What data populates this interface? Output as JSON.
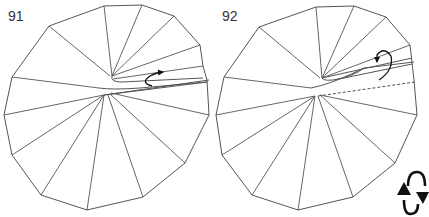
{
  "steps": [
    {
      "number": "91",
      "outline": [
        [
          104,
          6
        ],
        [
          142,
          5
        ],
        [
          174,
          16
        ],
        [
          200,
          45
        ],
        [
          203,
          66
        ],
        [
          207,
          80
        ],
        [
          209,
          115
        ],
        [
          185,
          163
        ],
        [
          143,
          197
        ],
        [
          87,
          210
        ],
        [
          41,
          195
        ],
        [
          12,
          155
        ],
        [
          4,
          115
        ],
        [
          12,
          77
        ],
        [
          49,
          26
        ]
      ],
      "creases": [
        [
          [
            104,
            6
          ],
          [
            112,
            76
          ]
        ],
        [
          [
            142,
            5
          ],
          [
            112,
            76
          ]
        ],
        [
          [
            174,
            16
          ],
          [
            112,
            76
          ]
        ],
        [
          [
            200,
            45
          ],
          [
            112,
            76
          ]
        ],
        [
          [
            203,
            66
          ],
          [
            113,
            79
          ]
        ],
        [
          [
            49,
            26
          ],
          [
            110,
            76
          ]
        ],
        [
          [
            12,
            77
          ],
          [
            99,
            88
          ]
        ],
        [
          [
            4,
            115
          ],
          [
            104,
            95
          ]
        ],
        [
          [
            12,
            155
          ],
          [
            104,
            95
          ]
        ],
        [
          [
            41,
            195
          ],
          [
            104,
            95
          ]
        ],
        [
          [
            87,
            210
          ],
          [
            104,
            95
          ]
        ],
        [
          [
            143,
            197
          ],
          [
            108,
            95
          ]
        ],
        [
          [
            185,
            163
          ],
          [
            110,
            94
          ]
        ],
        [
          [
            209,
            115
          ],
          [
            111,
            93
          ]
        ]
      ],
      "fold_paths": [
        "M112,76 Q110,82 122,82 L203,78",
        "M99,88 Q112,90 140,88 L207,82",
        "M104,95 L207,82",
        "M104,95 L209,80"
      ],
      "arrow_path": "M152,86 Q140,83 150,76 Q158,72 163,72"
    },
    {
      "number": "92",
      "outline": [
        [
          102,
          7
        ],
        [
          140,
          6
        ],
        [
          172,
          17
        ],
        [
          196,
          45
        ],
        [
          200,
          80
        ],
        [
          203,
          115
        ],
        [
          181,
          163
        ],
        [
          139,
          197
        ],
        [
          84,
          210
        ],
        [
          38,
          195
        ],
        [
          8,
          155
        ],
        [
          2,
          115
        ],
        [
          10,
          77
        ],
        [
          45,
          27
        ]
      ],
      "creases": [
        [
          [
            102,
            7
          ],
          [
            108,
            78
          ]
        ],
        [
          [
            140,
            6
          ],
          [
            108,
            78
          ]
        ],
        [
          [
            172,
            17
          ],
          [
            108,
            78
          ]
        ],
        [
          [
            196,
            45
          ],
          [
            108,
            78
          ]
        ],
        [
          [
            45,
            27
          ],
          [
            106,
            78
          ]
        ],
        [
          [
            10,
            77
          ],
          [
            97,
            88
          ]
        ],
        [
          [
            2,
            115
          ],
          [
            101,
            96
          ]
        ],
        [
          [
            8,
            155
          ],
          [
            101,
            96
          ]
        ],
        [
          [
            38,
            195
          ],
          [
            101,
            96
          ]
        ],
        [
          [
            84,
            210
          ],
          [
            101,
            96
          ]
        ],
        [
          [
            139,
            197
          ],
          [
            104,
            96
          ]
        ],
        [
          [
            181,
            163
          ],
          [
            106,
            95
          ]
        ],
        [
          [
            203,
            115
          ],
          [
            106,
            95
          ]
        ]
      ],
      "fold_paths": [
        "M108,78 Q110,82 125,79 L198,64",
        "M108,78 L198,58",
        "M97,88 Q118,84 150,68",
        "M150,68 L200,62",
        "M150,68 Q140,76 120,80"
      ],
      "dashed_path": "M104,96 L201,82",
      "arrow_path": "M165,80 Q180,70 177,56 Q170,46 163,55 L163,62"
    }
  ],
  "icons": {
    "turn_over": "turn-over-icon"
  },
  "colors": {
    "line": "#555555",
    "arrow": "#111111"
  }
}
